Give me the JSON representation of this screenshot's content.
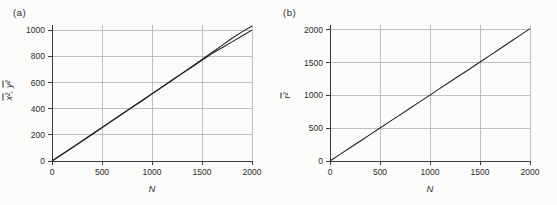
{
  "figure": {
    "panels": {
      "a": {
        "label": "(a)",
        "xlabel": "N",
        "ylabel": {
          "term1": "x²",
          "separator": ", ",
          "term2": "y²"
        }
      },
      "b": {
        "label": "(b)",
        "xlabel": "N",
        "ylabel": {
          "term1": "r²"
        }
      }
    }
  },
  "colors": {
    "line": "#222222",
    "grid": "#b0b0b0",
    "axis": "#3a3a3a",
    "text": "#2b2b2b",
    "background": "#fbfbf9"
  },
  "chart_data": [
    {
      "type": "line",
      "panel": "a",
      "title": "",
      "xlabel": "N",
      "ylabel": "x̄², ȳ²",
      "xlim": [
        0,
        2000
      ],
      "ylim": [
        0,
        1040
      ],
      "xticks": [
        0,
        500,
        1000,
        1500,
        2000
      ],
      "yticks": [
        0,
        200,
        400,
        600,
        800,
        1000
      ],
      "grid": true,
      "legend": "none",
      "x": [
        0,
        100,
        200,
        300,
        400,
        500,
        600,
        700,
        800,
        900,
        1000,
        1100,
        1200,
        1300,
        1400,
        1500,
        1600,
        1700,
        1800,
        1900,
        2000
      ],
      "series": [
        {
          "name": "x̄²",
          "values": [
            0,
            49,
            100,
            151,
            203,
            255,
            307,
            358,
            410,
            461,
            513,
            566,
            618,
            670,
            723,
            776,
            830,
            884,
            938,
            987,
            1032
          ]
        },
        {
          "name": "ȳ²",
          "values": [
            0,
            51,
            102,
            154,
            205,
            257,
            308,
            360,
            411,
            463,
            514,
            565,
            617,
            668,
            719,
            770,
            821,
            866,
            911,
            956,
            1001
          ]
        }
      ]
    },
    {
      "type": "line",
      "panel": "b",
      "title": "",
      "xlabel": "N",
      "ylabel": "r̄²",
      "xlim": [
        0,
        2000
      ],
      "ylim": [
        0,
        2075
      ],
      "xticks": [
        0,
        500,
        1000,
        1500,
        2000
      ],
      "yticks": [
        0,
        500,
        1000,
        1500,
        2000
      ],
      "grid": true,
      "legend": "none",
      "x": [
        0,
        100,
        200,
        300,
        400,
        500,
        600,
        700,
        800,
        900,
        1000,
        1100,
        1200,
        1300,
        1400,
        1500,
        1600,
        1700,
        1800,
        1900,
        2000
      ],
      "series": [
        {
          "name": "r̄²",
          "values": [
            0,
            101,
            202,
            302,
            403,
            503,
            604,
            704,
            805,
            906,
            1006,
            1107,
            1208,
            1308,
            1409,
            1510,
            1611,
            1713,
            1815,
            1917,
            2020
          ]
        }
      ]
    }
  ]
}
